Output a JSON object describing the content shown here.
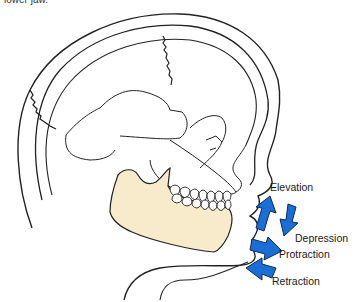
{
  "caption": {
    "text": "lower jaw."
  },
  "figure": {
    "colors": {
      "mandible_fill": "#f8ebcc",
      "arrow_fill": "#1a6fd6",
      "arrow_stroke": "#0d2a55",
      "line": "#222222"
    },
    "movements": [
      {
        "label": "Elevation",
        "direction": "up"
      },
      {
        "label": "Depression",
        "direction": "down"
      },
      {
        "label": "Protraction",
        "direction": "forward"
      },
      {
        "label": "Retraction",
        "direction": "backward"
      }
    ]
  }
}
